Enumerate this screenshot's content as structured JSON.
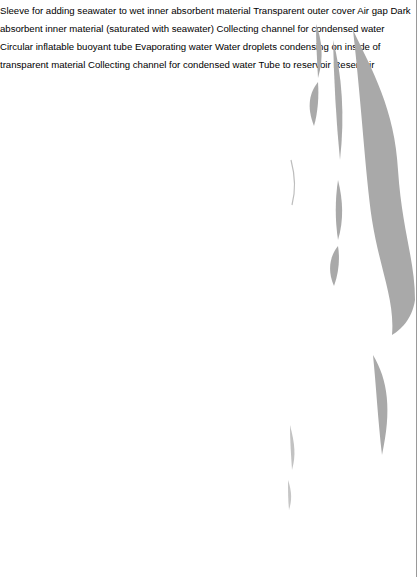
{
  "figure": {
    "orientation": "rotated 90 degrees counter-clockwise",
    "colors": {
      "background": "#ffffff",
      "wave_gray": "#a9a9a9",
      "buoy_gray": "#8e8e8e",
      "absorbent_dark": "#6e6e6e",
      "base_black": "#0d0d0d",
      "channel_light": "#dcdcdc",
      "line": "#2a2a2a"
    }
  },
  "labels": {
    "sleeve": [
      "Sleeve for adding seawater",
      "to wet inner absorbent material"
    ],
    "outer_cover": [
      "Transparent outer cover"
    ],
    "air_gap": [
      "Air gap"
    ],
    "absorbent": [
      "Dark absorbent inner",
      "material (saturated with",
      "seawater)"
    ],
    "channel_upper": [
      "Collecting channel",
      "for condensed",
      "water"
    ],
    "buoyant_tube": [
      "Circular inflatable buoyant",
      "tube"
    ],
    "evaporating": [
      "Evaporating water"
    ],
    "droplets": [
      "Water droplets condensing",
      "on inside of transparent",
      "material"
    ],
    "channel_lower": [
      "Collecting channel",
      "for condensed",
      "water"
    ],
    "tube_to_reservoir": [
      "Tube to reservoir"
    ],
    "reservoir": [
      "Reservoir"
    ]
  }
}
